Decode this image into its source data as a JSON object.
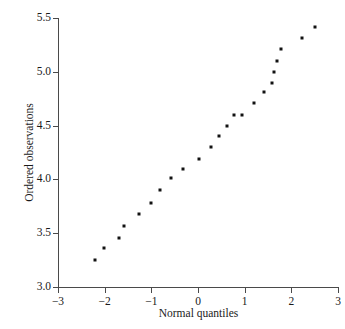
{
  "chart_data": {
    "type": "scatter",
    "title": "",
    "xlabel": "Normal quantiles",
    "ylabel": "Ordered observations",
    "xlim": [
      -3,
      3
    ],
    "ylim": [
      3.0,
      5.5
    ],
    "xticks": [
      -3,
      -2,
      -1,
      0,
      1,
      2,
      3
    ],
    "xtick_labels": [
      "−3",
      "−2",
      "−1",
      "0",
      "1",
      "2",
      "3"
    ],
    "yticks": [
      3.0,
      3.5,
      4.0,
      4.5,
      5.0,
      5.5
    ],
    "ytick_labels": [
      "3.0",
      "3.5",
      "4.0",
      "4.5",
      "5.0",
      "5.5"
    ],
    "grid": false,
    "legend": null,
    "marker": {
      "shape": "square",
      "color": "#121212",
      "size_px": 3
    },
    "axis_color": "#4a4a4a",
    "background": "#ffffff",
    "n_points": 24,
    "x": [
      -2.2,
      -2.02,
      -1.7,
      -1.58,
      -1.27,
      -1.0,
      -0.82,
      -0.57,
      -0.32,
      -0.16,
      0.02,
      0.28,
      0.46,
      0.62,
      0.78,
      0.95,
      1.2,
      1.41,
      1.58,
      1.66,
      1.75,
      1.81,
      2.22,
      2.5
    ],
    "y": [
      3.25,
      3.36,
      3.46,
      3.57,
      3.68,
      3.78,
      3.9,
      4.01,
      4.1,
      4.1,
      4.19,
      4.3,
      4.4,
      4.5,
      4.6,
      4.6,
      4.71,
      4.81,
      4.9,
      5.0,
      5.1,
      5.21,
      5.31,
      5.42
    ],
    "points": [
      {
        "x": -2.2,
        "y": 3.25
      },
      {
        "x": -2.02,
        "y": 3.36
      },
      {
        "x": -1.7,
        "y": 3.46
      },
      {
        "x": -1.58,
        "y": 3.57
      },
      {
        "x": -1.27,
        "y": 3.68
      },
      {
        "x": -1.0,
        "y": 3.78
      },
      {
        "x": -0.82,
        "y": 3.9
      },
      {
        "x": -0.57,
        "y": 4.01
      },
      {
        "x": -0.32,
        "y": 4.1
      },
      {
        "x": 0.02,
        "y": 4.19
      },
      {
        "x": 0.28,
        "y": 4.3
      },
      {
        "x": 0.46,
        "y": 4.4
      },
      {
        "x": 0.62,
        "y": 4.5
      },
      {
        "x": 0.78,
        "y": 4.6
      },
      {
        "x": 0.95,
        "y": 4.6
      },
      {
        "x": 1.2,
        "y": 4.71
      },
      {
        "x": 1.41,
        "y": 4.81
      },
      {
        "x": 1.58,
        "y": 4.9
      },
      {
        "x": 1.63,
        "y": 5.0
      },
      {
        "x": 1.7,
        "y": 5.1
      },
      {
        "x": 1.78,
        "y": 5.21
      },
      {
        "x": 2.22,
        "y": 5.31
      },
      {
        "x": 2.5,
        "y": 5.42
      }
    ]
  }
}
